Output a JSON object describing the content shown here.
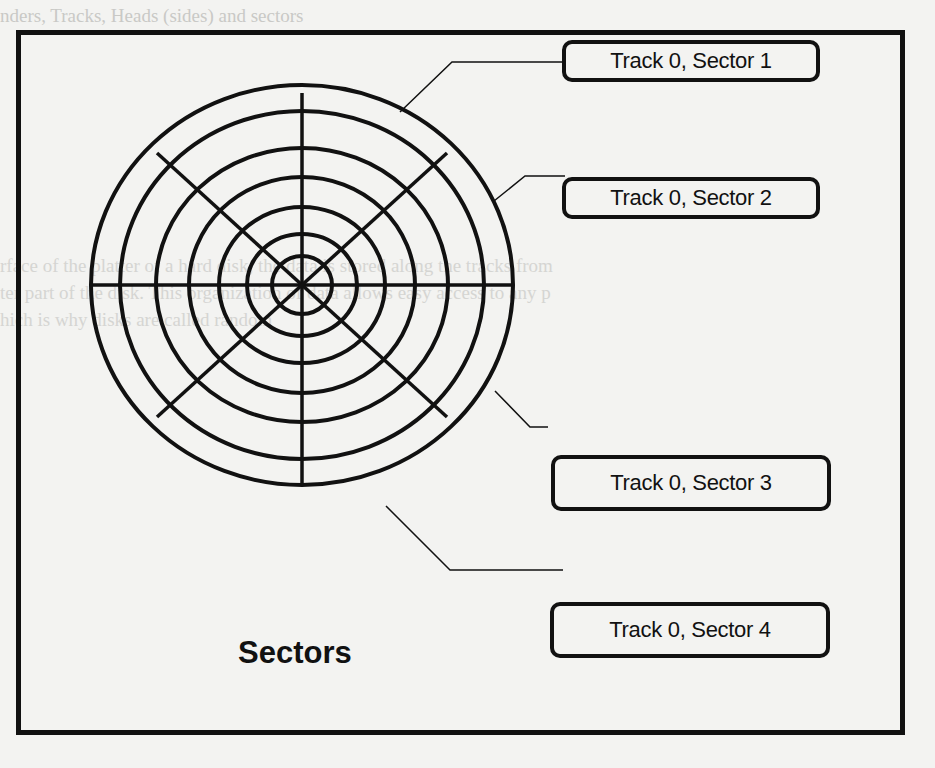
{
  "diagram": {
    "title": "Sectors",
    "labels": [
      {
        "text": "Track 0, Sector 1"
      },
      {
        "text": "Track 0, Sector 2"
      },
      {
        "text": "Track 0, Sector 3"
      },
      {
        "text": "Track 0, Sector 4"
      }
    ],
    "disk": {
      "tracks": 7,
      "sector_dividers": 8
    }
  },
  "background_bleed": {
    "line1": "nders, Tracks, Heads (sides) and sectors",
    "line2": "rface of the platter of a hard disk, the data is stored along the tracks from",
    "line3": "ter part of the disk. This organization of data allows easy access to any p",
    "line4": "hich is why disks are called random"
  }
}
